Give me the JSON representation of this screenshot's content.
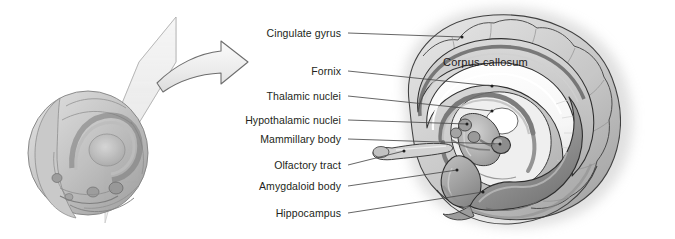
{
  "figure": {
    "panels": {
      "left": {
        "name": "3D brain with sagittal cutting plane",
        "description": "Lateral view of whole brain with a translucent sagittal section plane"
      },
      "arrow": {
        "name": "magnification-arrow",
        "direction": "right"
      },
      "right": {
        "name": "Midsagittal limbic system illustration"
      }
    }
  },
  "labels": [
    {
      "id": "cingulate-gyrus",
      "text": "Cingulate gyrus",
      "text_x": 345,
      "text_y": 33,
      "line_x2": 462,
      "line_y2": 37,
      "dot": true
    },
    {
      "id": "fornix",
      "text": "Fornix",
      "text_x": 345,
      "text_y": 71,
      "line_x2": 492,
      "line_y2": 86,
      "dot": true
    },
    {
      "id": "thalamic-nuclei",
      "text": "Thalamic nuclei",
      "text_x": 345,
      "text_y": 96,
      "line_x2": 492,
      "line_y2": 111,
      "dot": true
    },
    {
      "id": "hypothalamic-nuclei",
      "text": "Hypothalamic nuclei",
      "text_x": 345,
      "text_y": 120,
      "line_x2": 467,
      "line_y2": 124,
      "dot": true
    },
    {
      "id": "mammillary-body",
      "text": "Mammillary body",
      "text_x": 345,
      "text_y": 139,
      "line_x2": 500,
      "line_y2": 144,
      "dot": true
    },
    {
      "id": "olfactory-tract",
      "text": "Olfactory tract",
      "text_x": 345,
      "text_y": 165,
      "line_x2": 404,
      "line_y2": 151,
      "dot": true
    },
    {
      "id": "amygdaloid-body",
      "text": "Amygdaloid body",
      "text_x": 345,
      "text_y": 186,
      "line_x2": 457,
      "line_y2": 170,
      "dot": true
    },
    {
      "id": "hippocampus",
      "text": "Hippocampus",
      "text_x": 345,
      "text_y": 213,
      "line_x2": 483,
      "line_y2": 192,
      "dot": true
    }
  ],
  "overlay_labels": [
    {
      "id": "corpus-callosum",
      "text": "Corpus callosum",
      "x": 443,
      "y": 62
    }
  ],
  "colors": {
    "text": "#231f20",
    "leader_line": "#4a4a4a",
    "outline": "#2b2b2b",
    "cortex_light": "#d7d7d7",
    "cortex_mid": "#b5b5b5",
    "cortex_dark": "#8e8e8e",
    "corpus_callosum_fill": "#fafafa",
    "deep_gray": "#8a8a8a",
    "hippocampus": "#9a9a9a",
    "amygdala": "#909090",
    "plane_fill": "#e3e3e3",
    "arrow_fill": "#ededed",
    "arrow_stroke": "#6e6e6e",
    "background": "#ffffff"
  }
}
